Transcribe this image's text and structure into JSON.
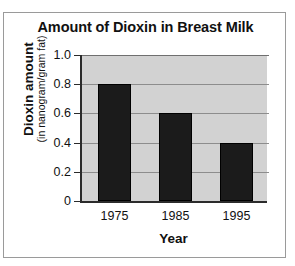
{
  "chart_data": {
    "type": "bar",
    "title": "Amount of Dioxin in Breast Milk",
    "xlabel": "Year",
    "ylabel": "Dioxin amount",
    "ylabel_sub": "(in nanogram/gram fat)",
    "categories": [
      "1975",
      "1985",
      "1995"
    ],
    "values": [
      0.8,
      0.6,
      0.4
    ],
    "ylim": [
      0,
      1.0
    ],
    "yticks": [
      0,
      0.2,
      0.4,
      0.6,
      0.8,
      1.0
    ],
    "ytick_labels": [
      "0",
      "0.2",
      "0.4",
      "0.6",
      "0.8",
      "1.0"
    ],
    "grid": true,
    "legend": "none",
    "bar_color": "#1b1b1b",
    "plot_background": "#d2d2d2",
    "axis_color": "#2b2b2b",
    "gridline_color": "#8d8d8d"
  }
}
